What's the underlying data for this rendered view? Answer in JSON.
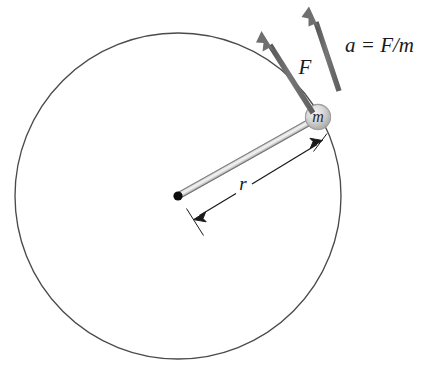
{
  "figure": {
    "background_color": "#ffffff",
    "width": 425,
    "height": 372
  },
  "labels": {
    "force": "F",
    "acceleration": "a = F/m",
    "radius": "r",
    "mass": "m"
  },
  "colors": {
    "circle_outline": "#4a4a4a",
    "arrow_vector": "#6f6f6f",
    "dimension_line": "#1a1a1a",
    "pivot": "#0d0d0d",
    "rod_light": "#d8d8d8",
    "rod_edge": "#8d8d8d",
    "mass_fill": "#cfcfcf",
    "mass_edge": "#8a8a8a",
    "text": "#1a1a1a"
  },
  "geometry": {
    "circle": {
      "cx": 178,
      "cy": 196,
      "r": 163
    },
    "pivot": {
      "x": 178,
      "y": 196,
      "radius": 4.5
    },
    "mass": {
      "x": 318,
      "y": 117,
      "radius": 12.5
    },
    "rod": {
      "x1": 178,
      "y1": 196,
      "x2": 315,
      "y2": 119,
      "width": 6
    },
    "force_arrow": {
      "x1": 312,
      "y1": 112,
      "x2": 263,
      "y2": 34
    },
    "acceleration_arrow": {
      "x1": 339,
      "y1": 91,
      "x2": 310,
      "y2": 9
    },
    "dimension_r": {
      "x1": 196,
      "y1": 218,
      "x2": 320,
      "y2": 142
    }
  },
  "label_positions": {
    "force": {
      "x": 305,
      "y": 69
    },
    "acceleration": {
      "x": 345,
      "y": 47
    },
    "radius": {
      "x": 243,
      "y": 185
    },
    "mass": {
      "x": 318,
      "y": 118
    }
  }
}
